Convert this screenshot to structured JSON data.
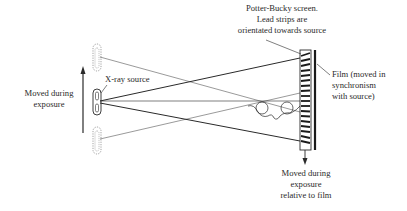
{
  "labels": {
    "source_motion": [
      "Moved during",
      "exposure"
    ],
    "xray_source": "X-ray source",
    "bucky": [
      "Potter-Bucky screen.",
      "Lead strips are",
      "orientated towards source"
    ],
    "film": [
      "Film (moved in",
      "synchronism",
      "with source)"
    ],
    "grid_motion": [
      "Moved during",
      "exposure",
      "relative to film"
    ]
  },
  "colors": {
    "line": "#2a2a2a",
    "dotted": "#888888",
    "background": "#ffffff"
  }
}
